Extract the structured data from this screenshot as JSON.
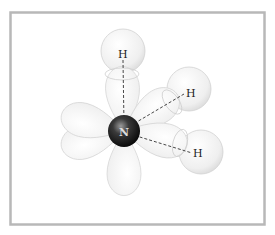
{
  "diagram": {
    "central_atom": {
      "label": "N",
      "x": 124,
      "y": 131,
      "r": 16
    },
    "hydrogens": [
      {
        "label": "H",
        "label_x": 122,
        "label_y": 57,
        "sphere_x": 123,
        "sphere_y": 51,
        "r": 22
      },
      {
        "label": "H",
        "label_x": 190,
        "label_y": 97,
        "sphere_x": 189,
        "sphere_y": 89,
        "r": 22
      },
      {
        "label": "H",
        "label_x": 198,
        "label_y": 157,
        "sphere_x": 201,
        "sphere_y": 152,
        "r": 22
      }
    ],
    "colors": {
      "frame": "#b8b8b8",
      "lobe_fill": "#f1f1f1",
      "lobe_stroke": "#d6d6d6",
      "nucleus_dark": "#111111",
      "bond_line": "#333333"
    }
  }
}
